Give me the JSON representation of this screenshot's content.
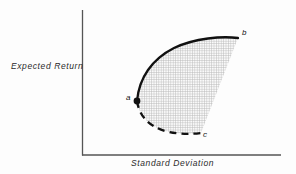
{
  "figure": {
    "background_color": "#fdfdfd",
    "width": 296,
    "height": 174
  },
  "axes": {
    "y_label": "Expected Return",
    "x_label": "Standard Deviation",
    "axis_color": "#555555",
    "origin": {
      "x": 82,
      "y": 155
    },
    "y_axis_top": {
      "x": 82,
      "y": 10
    },
    "x_axis_right": {
      "x": 281,
      "y": 155
    }
  },
  "region": {
    "name": "feasible-set",
    "fill_pattern": "crosshatch-grid",
    "pattern_color": "#b8b8b8",
    "pattern_pitch": 2.4,
    "fill_color": "#fafafa"
  },
  "curves": [
    {
      "name": "efficient-frontier",
      "style": "solid",
      "color": "#111111",
      "width": 2.2,
      "from": "a",
      "to": "b",
      "path": "M 137,101 C 139,78 152,59 174,48 C 195,38 222,36 238,38"
    },
    {
      "name": "inefficient-lower-boundary",
      "style": "dashed",
      "color": "#111111",
      "width": 2.2,
      "dash": "7,5",
      "from": "a",
      "to": "c",
      "path": "M 137,101 C 139,115 148,126 165,131 C 180,135 193,134 201,133"
    },
    {
      "name": "right-edge",
      "style": "implicit",
      "color": "none",
      "from": "b",
      "to": "c",
      "path": "M 238,38 L 201,133"
    }
  ],
  "points": [
    {
      "id": "a",
      "label": "a",
      "x": 137,
      "y": 101,
      "marker": "filled-dot",
      "marker_radius": 3.4,
      "color": "#111111"
    },
    {
      "id": "b",
      "label": "b",
      "x": 238,
      "y": 38,
      "marker": "none",
      "color": "#111111"
    },
    {
      "id": "c",
      "label": "c",
      "x": 201,
      "y": 133,
      "marker": "none",
      "color": "#111111"
    }
  ]
}
